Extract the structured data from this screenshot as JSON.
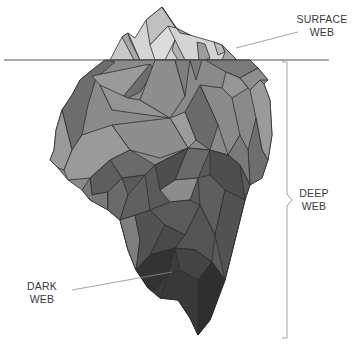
{
  "diagram": {
    "type": "iceberg-metaphor",
    "labels": {
      "surface": {
        "line1": "SURFACE",
        "line2": "WEB"
      },
      "deep": {
        "line1": "DEEP",
        "line2": "WEB"
      },
      "dark": {
        "line1": "DARK",
        "line2": "WEB"
      }
    },
    "colors": {
      "tip_light": "#dcdcdc",
      "tip_mid": "#c4c4c4",
      "tip_shadow": "#a8a8a8",
      "upper_light": "#9a9a9a",
      "upper_mid": "#8a8a8a",
      "upper_dark": "#6e6e6e",
      "deep_mid": "#5e5e5e",
      "deep_dark": "#4e4e4e",
      "dark_web": "#3c3c3c",
      "edge": "#2e2e2e",
      "waterline": "#555555",
      "leader": "#8c8c8c"
    }
  }
}
